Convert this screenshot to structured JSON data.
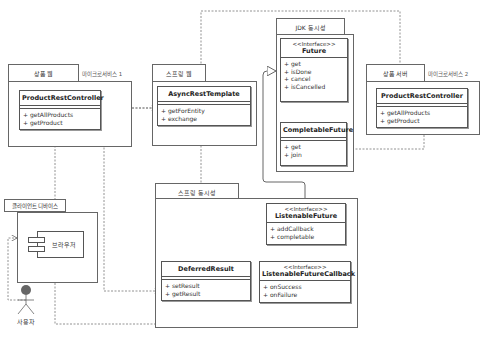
{
  "packages": {
    "product_web": {
      "label": "상품 웹",
      "note": "마이크로서비스 1"
    },
    "spring_web": {
      "label": "스프링 웹"
    },
    "jdk_concurrency": {
      "label": "JDK 동시성"
    },
    "product_server": {
      "label": "상품 서버",
      "note": "마이크로서비스 2"
    },
    "spring_concurrency": {
      "label": "스프링 동시성"
    },
    "client_device": {
      "label": "클라이언트 디바이스"
    }
  },
  "classes": {
    "product_rest_controller_1": {
      "name": "ProductRestController",
      "methods": [
        "getAllProducts",
        "getProduct"
      ]
    },
    "async_rest_template": {
      "name": "AsyncRestTemplate",
      "methods": [
        "getForEntity",
        "exchange"
      ]
    },
    "future": {
      "stereotype": "<<Interface>>",
      "name": "Future",
      "methods": [
        "get",
        "isDone",
        "cancel",
        "isCancelled"
      ]
    },
    "completable_future": {
      "name": "CompletableFuture",
      "methods": [
        "get",
        "join"
      ]
    },
    "product_rest_controller_2": {
      "name": "ProductRestController",
      "methods": [
        "getAllProducts",
        "getProduct"
      ]
    },
    "listenable_future": {
      "stereotype": "<<Interface>>",
      "name": "ListenableFuture",
      "methods": [
        "addCallback",
        "completable"
      ]
    },
    "deferred_result": {
      "name": "DeferredResult",
      "methods": [
        "setResult",
        "getResult"
      ]
    },
    "listenable_future_callback": {
      "stereotype": "<<Interface>>",
      "name": "ListenableFutureCallback",
      "methods": [
        "onSuccess",
        "onFailure"
      ]
    }
  },
  "components": {
    "browser": {
      "label": "브라우저"
    }
  },
  "actors": {
    "user": {
      "label": "사용자"
    }
  },
  "colors": {
    "line": "#666666",
    "dashed": "#777777",
    "background": "#ffffff"
  }
}
